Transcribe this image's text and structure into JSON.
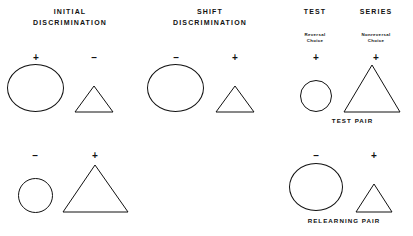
{
  "figure": {
    "title_row": [
      {
        "id": "initial",
        "line1": "INITIAL",
        "line2": "DISCRIMINATION"
      },
      {
        "id": "shift",
        "line1": "SHIFT",
        "line2": "DISCRIMINATION"
      },
      {
        "id": "test",
        "line1": "TEST",
        "line2": ""
      },
      {
        "id": "series",
        "line1": "SERIES",
        "line2": ""
      }
    ],
    "sublabels": [
      {
        "id": "reversal",
        "line1": "Reversal",
        "line2": "Choice"
      },
      {
        "id": "nonreversal",
        "line1": "Nonreversal",
        "line2": "Choice"
      }
    ],
    "footer_labels": [
      {
        "id": "test-pair",
        "text": "TEST  PAIR"
      },
      {
        "id": "relearning-pair",
        "text": "RELEARNING  PAIR"
      }
    ],
    "signs": {
      "plus": "+",
      "minus": "–"
    },
    "stimuli": [
      {
        "id": "initial-top-circle",
        "shape": "circle",
        "sign": "+",
        "size": "large"
      },
      {
        "id": "initial-top-triangle",
        "shape": "triangle",
        "sign": "–",
        "size": "small"
      },
      {
        "id": "initial-bottom-circle",
        "shape": "circle",
        "sign": "–",
        "size": "small"
      },
      {
        "id": "initial-bottom-triangle",
        "shape": "triangle",
        "sign": "+",
        "size": "large"
      },
      {
        "id": "shift-top-circle",
        "shape": "circle",
        "sign": "–",
        "size": "large"
      },
      {
        "id": "shift-top-triangle",
        "shape": "triangle",
        "sign": "+",
        "size": "small"
      },
      {
        "id": "test-pair-circle",
        "shape": "circle",
        "sign": "+",
        "size": "small"
      },
      {
        "id": "test-pair-triangle",
        "shape": "triangle",
        "sign": "+",
        "size": "large"
      },
      {
        "id": "relearning-pair-circle",
        "shape": "circle",
        "sign": "–",
        "size": "large"
      },
      {
        "id": "relearning-pair-triangle",
        "shape": "triangle",
        "sign": "+",
        "size": "small"
      }
    ],
    "colors": {
      "background": "#ffffff",
      "ink": "#111111"
    }
  }
}
